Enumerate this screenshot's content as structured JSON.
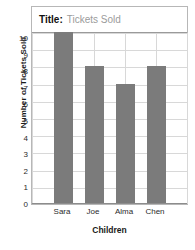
{
  "chart_data": {
    "type": "bar",
    "title": "Tickets Sold",
    "title_prefix": "Title:",
    "categories": [
      "Sara",
      "Joe",
      "Alma",
      "Chen"
    ],
    "values": [
      10,
      8,
      7,
      8
    ],
    "xlabel": "Children",
    "ylabel": "Number of Tickets Sold",
    "ylim": [
      0,
      10
    ],
    "ytick_labels": [
      "0",
      "1",
      "2",
      "3",
      "4",
      "5",
      "6",
      "7",
      "8",
      "9",
      "10"
    ],
    "ytick_values": [
      0,
      1,
      2,
      3,
      4,
      5,
      6,
      7,
      8,
      9,
      10
    ],
    "grid": true,
    "legend": "none",
    "bar_color": "#7b7b7b",
    "grid_color": "#d8d8d8",
    "border_color": "#b7b7b7",
    "title_value_color": "#9b9b9b"
  }
}
